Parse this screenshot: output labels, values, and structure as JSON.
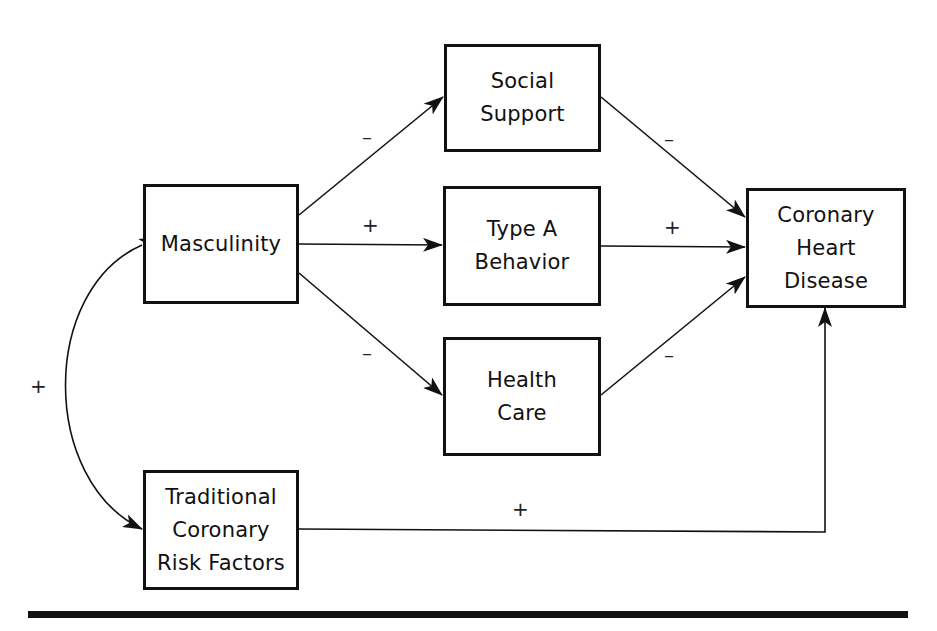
{
  "diagram": {
    "nodes": {
      "masculinity": {
        "lines": [
          "Masculinity"
        ]
      },
      "social_support": {
        "lines": [
          "Social",
          "Support"
        ]
      },
      "type_a": {
        "lines": [
          "Type A",
          "Behavior"
        ]
      },
      "health_care": {
        "lines": [
          "Health",
          "Care"
        ]
      },
      "chd": {
        "lines": [
          "Coronary",
          "Heart",
          "Disease"
        ]
      },
      "risk_factors": {
        "lines": [
          "Traditional",
          "Coronary",
          "Risk Factors"
        ]
      }
    },
    "edges": [
      {
        "from": "Masculinity",
        "to": "Social Support",
        "sign": "–"
      },
      {
        "from": "Masculinity",
        "to": "Type A Behavior",
        "sign": "+"
      },
      {
        "from": "Masculinity",
        "to": "Health Care",
        "sign": "–"
      },
      {
        "from": "Social Support",
        "to": "Coronary Heart Disease",
        "sign": "–"
      },
      {
        "from": "Type A Behavior",
        "to": "Coronary Heart Disease",
        "sign": "+"
      },
      {
        "from": "Health Care",
        "to": "Coronary Heart Disease",
        "sign": "–"
      },
      {
        "from": "Traditional Coronary Risk Factors",
        "to": "Coronary Heart Disease",
        "sign": "+"
      },
      {
        "from": "Masculinity",
        "to": "Traditional Coronary Risk Factors",
        "sign": "+",
        "bidirectional": true
      }
    ],
    "signs": {
      "masc_social": "–",
      "masc_typea": "+",
      "masc_health": "–",
      "social_chd": "–",
      "typea_chd": "+",
      "health_chd": "–",
      "risk_chd": "+",
      "masc_risk": "+"
    },
    "colors": {
      "line": "#111111",
      "background": "#ffffff"
    }
  }
}
